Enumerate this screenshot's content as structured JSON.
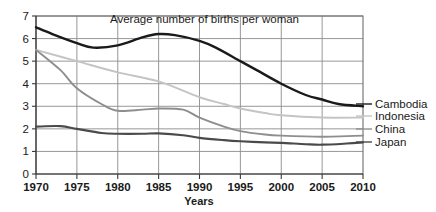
{
  "chart_data": {
    "type": "line",
    "title": "Average number of births per woman",
    "xlabel": "Years",
    "ylabel": "",
    "xlim": [
      1970,
      2010
    ],
    "ylim": [
      0,
      7
    ],
    "grid": true,
    "legend_position": "right-outside",
    "x": [
      1970,
      1975,
      1980,
      1985,
      1990,
      1995,
      2000,
      2005,
      2010
    ],
    "xtick_labels": [
      "1970",
      "1975",
      "1980",
      "1985",
      "1990",
      "1995",
      "2000",
      "2005",
      "2010"
    ],
    "ytick_labels": [
      "0",
      "1",
      "2",
      "3",
      "4",
      "5",
      "6",
      "7"
    ],
    "ytick_values": [
      0,
      1,
      2,
      3,
      4,
      5,
      6,
      7
    ],
    "series": [
      {
        "name": "Cambodia",
        "color": "#1a1a1a",
        "width": 2.4,
        "values": [
          6.5,
          5.8,
          5.7,
          6.2,
          5.9,
          5.0,
          4.0,
          3.3,
          3.0
        ],
        "points": [
          [
            1970,
            6.5
          ],
          [
            1972,
            6.2
          ],
          [
            1975,
            5.8
          ],
          [
            1977,
            5.6
          ],
          [
            1980,
            5.7
          ],
          [
            1983,
            6.05
          ],
          [
            1985,
            6.2
          ],
          [
            1987,
            6.15
          ],
          [
            1990,
            5.9
          ],
          [
            1992,
            5.6
          ],
          [
            1995,
            5.0
          ],
          [
            1997,
            4.6
          ],
          [
            2000,
            4.0
          ],
          [
            2003,
            3.5
          ],
          [
            2005,
            3.3
          ],
          [
            2007,
            3.1
          ],
          [
            2010,
            3.0
          ]
        ]
      },
      {
        "name": "Indonesia",
        "color": "#c4c4c4",
        "width": 1.9,
        "values": [
          5.5,
          5.0,
          4.5,
          4.1,
          3.4,
          2.9,
          2.6,
          2.5,
          2.5
        ],
        "points": [
          [
            1970,
            5.5
          ],
          [
            1975,
            5.0
          ],
          [
            1980,
            4.5
          ],
          [
            1985,
            4.1
          ],
          [
            1990,
            3.4
          ],
          [
            1993,
            3.1
          ],
          [
            1995,
            2.9
          ],
          [
            1998,
            2.7
          ],
          [
            2000,
            2.6
          ],
          [
            2005,
            2.5
          ],
          [
            2010,
            2.5
          ]
        ]
      },
      {
        "name": "China",
        "color": "#8e8e8e",
        "width": 1.9,
        "values": [
          5.5,
          3.8,
          2.8,
          2.9,
          2.5,
          1.9,
          1.7,
          1.65,
          1.7
        ],
        "points": [
          [
            1970,
            5.5
          ],
          [
            1973,
            4.6
          ],
          [
            1975,
            3.8
          ],
          [
            1978,
            3.1
          ],
          [
            1980,
            2.8
          ],
          [
            1983,
            2.85
          ],
          [
            1985,
            2.9
          ],
          [
            1988,
            2.85
          ],
          [
            1990,
            2.5
          ],
          [
            1993,
            2.1
          ],
          [
            1995,
            1.9
          ],
          [
            1998,
            1.75
          ],
          [
            2000,
            1.7
          ],
          [
            2005,
            1.65
          ],
          [
            2008,
            1.68
          ],
          [
            2010,
            1.7
          ]
        ]
      },
      {
        "name": "Japan",
        "color": "#4a4a4a",
        "width": 2.1,
        "values": [
          2.1,
          2.0,
          1.78,
          1.8,
          1.6,
          1.45,
          1.38,
          1.3,
          1.4
        ],
        "points": [
          [
            1970,
            2.1
          ],
          [
            1973,
            2.12
          ],
          [
            1975,
            2.0
          ],
          [
            1978,
            1.82
          ],
          [
            1980,
            1.78
          ],
          [
            1983,
            1.78
          ],
          [
            1985,
            1.8
          ],
          [
            1988,
            1.72
          ],
          [
            1990,
            1.6
          ],
          [
            1993,
            1.5
          ],
          [
            1995,
            1.45
          ],
          [
            1998,
            1.4
          ],
          [
            2000,
            1.38
          ],
          [
            2003,
            1.32
          ],
          [
            2005,
            1.3
          ],
          [
            2008,
            1.35
          ],
          [
            2010,
            1.4
          ]
        ]
      }
    ]
  },
  "legend": {
    "items": [
      {
        "label": "Cambodia",
        "color": "#1a1a1a"
      },
      {
        "label": "Indonesia",
        "color": "#c4c4c4"
      },
      {
        "label": "China",
        "color": "#8e8e8e"
      },
      {
        "label": "Japan",
        "color": "#4a4a4a"
      }
    ]
  }
}
